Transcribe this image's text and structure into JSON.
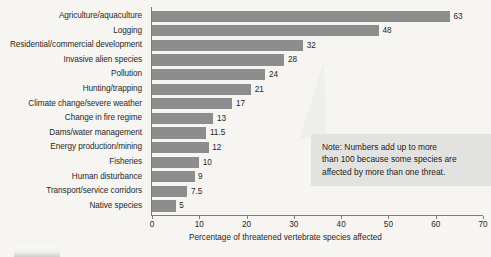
{
  "chart_data": {
    "type": "bar",
    "orientation": "horizontal",
    "title": "",
    "xlabel": "Percentage of threatened vertebrate species affected",
    "ylabel": "",
    "xlim": [
      0,
      70
    ],
    "xticks": [
      0,
      10,
      20,
      30,
      40,
      50,
      60,
      70
    ],
    "xtick_labels": [
      "0",
      "10",
      "20",
      "30",
      "40",
      "50",
      "60",
      "70"
    ],
    "grid": false,
    "legend": null,
    "bar_color": "#8d8d8d",
    "background_color": "#f6f5f2",
    "categories": [
      "Agriculture/aquaculture",
      "Logging",
      "Residential/commercial development",
      "Invasive alien species",
      "Pollution",
      "Hunting/trapping",
      "Climate change/severe weather",
      "Change in fire regime",
      "Dams/water management",
      "Energy production/mining",
      "Fisheries",
      "Human disturbance",
      "Transport/service corridors",
      "Native species"
    ],
    "values": [
      63,
      48,
      32,
      28,
      24,
      21,
      17,
      13,
      11.5,
      12,
      10,
      9,
      7.5,
      5
    ],
    "value_labels": [
      "63",
      "48",
      "32",
      "28",
      "24",
      "21",
      "17",
      "13",
      "11.5",
      "12",
      "10",
      "9",
      "7.5",
      "5"
    ],
    "annotations": [
      {
        "name": "note-callout",
        "lines": [
          "Note: Numbers add up to more",
          "than 100 because some species are",
          "affected by more than one threat."
        ],
        "background_color": "#e2e2e0"
      }
    ]
  }
}
